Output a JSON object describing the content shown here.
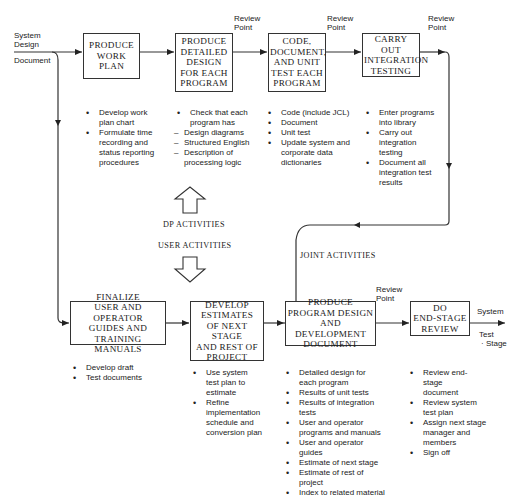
{
  "diagram": {
    "input_label": [
      "System",
      "Design",
      "Document"
    ],
    "review_point_label": [
      "Review",
      "Point"
    ],
    "top_row": [
      {
        "id": "produce-work-plan",
        "lines": [
          "PRODUCE",
          "WORK",
          "PLAN"
        ]
      },
      {
        "id": "produce-detailed-design",
        "lines": [
          "PRODUCE",
          "DETAILED",
          "DESIGN",
          "FOR EACH",
          "PROGRAM"
        ]
      },
      {
        "id": "code-document-unit-test",
        "lines": [
          "CODE,",
          "DOCUMENT,",
          "AND UNIT",
          "TEST EACH",
          "PROGRAM"
        ]
      },
      {
        "id": "carry-out-integration-testing",
        "lines": [
          "CARRY OUT",
          "INTEGRATION",
          "TESTING"
        ]
      }
    ],
    "bottom_row": [
      {
        "id": "finalize-guides",
        "lines": [
          "FINALIZE",
          "USER AND OPERATOR",
          "GUIDES AND",
          "TRAINING MANUALS"
        ]
      },
      {
        "id": "develop-estimates",
        "lines": [
          "DEVELOP",
          "ESTIMATES",
          "OF NEXT STAGE",
          "AND REST OF",
          "PROJECT"
        ]
      },
      {
        "id": "produce-program-design-doc",
        "lines": [
          "PRODUCE",
          "PROGRAM DESIGN",
          "AND DEVELOPMENT",
          "DOCUMENT"
        ]
      },
      {
        "id": "do-end-stage-review",
        "lines": [
          "DO",
          "END-STAGE",
          "REVIEW"
        ]
      }
    ],
    "top_bullets": [
      [
        {
          "type": "dot",
          "text": "Develop work plan chart"
        },
        {
          "type": "dot",
          "text": "Formulate time recording and status reporting procedures"
        }
      ],
      [
        {
          "type": "dot",
          "text": "Check that each program has"
        },
        {
          "type": "dash",
          "text": "Design diagrams"
        },
        {
          "type": "dash",
          "text": "Structured English"
        },
        {
          "type": "dash",
          "text": "Description of processing logic"
        }
      ],
      [
        {
          "type": "dot",
          "text": "Code (include JCL)"
        },
        {
          "type": "dot",
          "text": "Document"
        },
        {
          "type": "dot",
          "text": "Unit test"
        },
        {
          "type": "dot",
          "text": "Update system and corporate data dictionaries"
        }
      ],
      [
        {
          "type": "dot",
          "text": "Enter programs into library"
        },
        {
          "type": "dot",
          "text": "Carry out integration testing"
        },
        {
          "type": "dot",
          "text": "Document all integration test results"
        }
      ]
    ],
    "bottom_bullets": [
      [
        {
          "type": "dot",
          "text": "Develop draft"
        },
        {
          "type": "dot",
          "text": "Test documents"
        }
      ],
      [
        {
          "type": "dot",
          "text": "Use system test plan to estimate"
        },
        {
          "type": "dot",
          "text": "Refine implementation schedule and conversion plan"
        }
      ],
      [
        {
          "type": "dot",
          "text": "Detailed design for each program"
        },
        {
          "type": "dot",
          "text": "Results of unit tests"
        },
        {
          "type": "dot",
          "text": "Results of integration tests"
        },
        {
          "type": "dot",
          "text": "User and operator programs and manuals"
        },
        {
          "type": "dot",
          "text": "User and operator guides"
        },
        {
          "type": "dot",
          "text": "Estimate of next stage"
        },
        {
          "type": "dot",
          "text": "Estimate of rest of project"
        },
        {
          "type": "dot",
          "text": "Index to related material"
        }
      ],
      [
        {
          "type": "dot",
          "text": "Review end-stage document"
        },
        {
          "type": "dot",
          "text": "Review system test plan"
        },
        {
          "type": "dot",
          "text": "Assign next stage manager and members"
        },
        {
          "type": "dot",
          "text": "Sign off"
        }
      ]
    ],
    "dp_activities": "DP ACTIVITIES",
    "user_activities": "USER ACTIVITIES",
    "joint_activities": "JOINT ACTIVITIES",
    "output_label": {
      "top": "System",
      "bottom": [
        "Test",
        "Stage"
      ]
    }
  }
}
